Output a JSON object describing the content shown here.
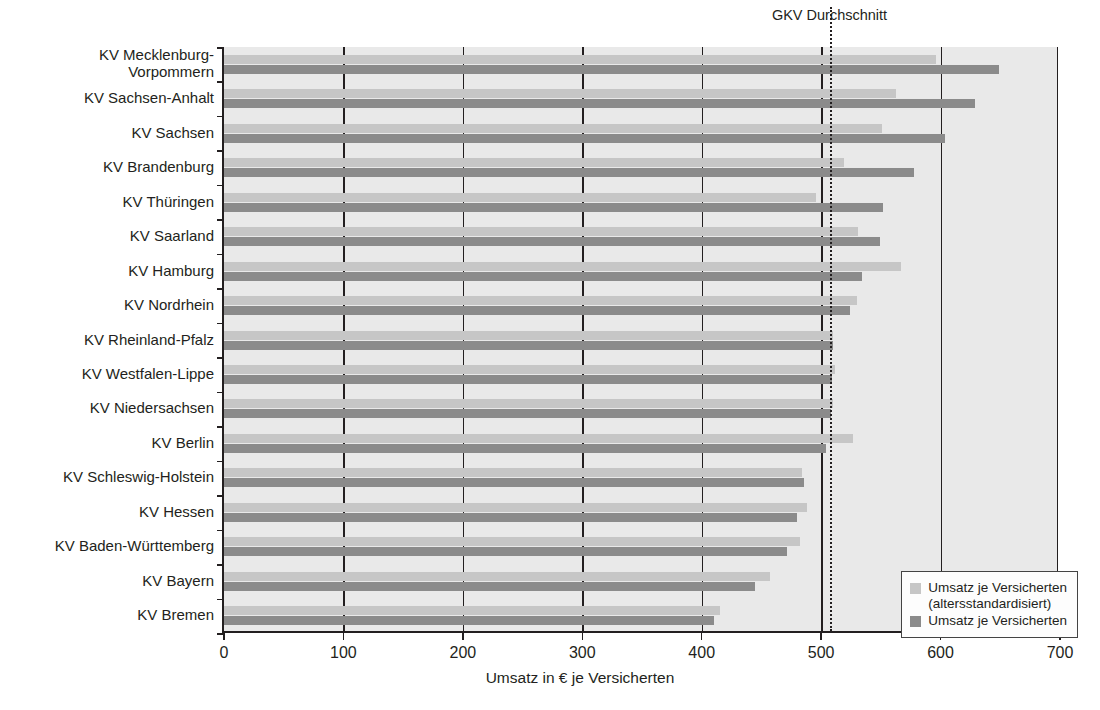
{
  "chart_data": {
    "type": "bar",
    "orientation": "horizontal",
    "title": "",
    "xlabel": "Umsatz in € je Versicherten",
    "ylabel": "",
    "xlim": [
      0,
      700
    ],
    "xticks": [
      0,
      100,
      200,
      300,
      400,
      500,
      600,
      700
    ],
    "xticklabels": [
      "0",
      "100",
      "200",
      "300",
      "400",
      "500",
      "600",
      "700"
    ],
    "grid": "vertical",
    "legend_position": "lower right",
    "categories": [
      "KV Mecklenburg-\nVorpommern",
      "KV Sachsen-Anhalt",
      "KV Sachsen",
      "KV Brandenburg",
      "KV Thüringen",
      "KV Saarland",
      "KV Hamburg",
      "KV Nordrhein",
      "KV Rheinland-Pfalz",
      "KV Westfalen-Lippe",
      "KV Niedersachsen",
      "KV Berlin",
      "KV Schleswig-Holstein",
      "KV Hessen",
      "KV Baden-Württemberg",
      "KV Bayern",
      "KV Bremen"
    ],
    "series": [
      {
        "name": "Umsatz je Versicherten\n(altersstandardisiert)",
        "color": "#c6c6c6",
        "values": [
          596,
          563,
          551,
          519,
          496,
          531,
          567,
          530,
          510,
          512,
          510,
          527,
          484,
          488,
          482,
          457,
          415
        ]
      },
      {
        "name": "Umsatz je Versicherten",
        "color": "#8b8b8b",
        "values": [
          649,
          629,
          604,
          578,
          552,
          549,
          534,
          524,
          510,
          509,
          508,
          504,
          486,
          480,
          471,
          445,
          410
        ]
      }
    ],
    "annotations": [
      {
        "label": "GKV Durchschnitt",
        "value": 507,
        "style": "dotted-vertical-line"
      }
    ]
  },
  "legend": {
    "items": [
      {
        "label": "Umsatz je Versicherten\n(altersstandardisiert)",
        "color": "#c6c6c6"
      },
      {
        "label": "Umsatz je Versicherten",
        "color": "#8b8b8b"
      }
    ]
  },
  "colors": {
    "light_bar": "#c6c6c6",
    "dark_bar": "#8b8b8b",
    "plot_background": "#e9e9e9",
    "axis": "#231f20"
  }
}
